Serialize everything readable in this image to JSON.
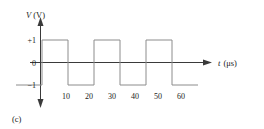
{
  "figure": {
    "caption": "(c)",
    "y_axis": {
      "label_variable": "V",
      "label_unit": "(V)",
      "ticks": [
        {
          "value": 1,
          "text": "+1"
        },
        {
          "value": 0,
          "text": "0"
        },
        {
          "value": -1,
          "text": "−1"
        }
      ]
    },
    "x_axis": {
      "label_variable": "t",
      "label_unit": "(μs)",
      "ticks": [
        {
          "value": 10,
          "text": "10"
        },
        {
          "value": 20,
          "text": "20"
        },
        {
          "value": 30,
          "text": "30"
        },
        {
          "value": 40,
          "text": "40"
        },
        {
          "value": 50,
          "text": "50"
        },
        {
          "value": 60,
          "text": "60"
        }
      ]
    }
  },
  "chart_data": {
    "type": "line",
    "title": "",
    "subtitle": "",
    "xlabel": "t (μs)",
    "ylabel": "V (V)",
    "xlim": [
      0,
      72
    ],
    "ylim": [
      -1.6,
      1.6
    ],
    "grid": false,
    "legend": null,
    "annotations": [
      "(c)"
    ],
    "waveform": "square",
    "period": 20,
    "amplitude": 1,
    "high_level": 1,
    "low_level": -1,
    "duty_cycle": 0.5,
    "starts_at": -1,
    "transitions": [
      10,
      20,
      30,
      40,
      50,
      60
    ],
    "xticks": [
      10,
      20,
      30,
      40,
      50,
      60
    ],
    "yticks": [
      -1,
      0,
      1
    ],
    "series": [
      {
        "name": "V(t)",
        "color": "#8c8c8c",
        "x": [
          0,
          10,
          10,
          20,
          20,
          30,
          30,
          40,
          40,
          50,
          50,
          60,
          60,
          70
        ],
        "values": [
          -1,
          -1,
          1,
          1,
          -1,
          -1,
          1,
          1,
          -1,
          -1,
          1,
          1,
          -1,
          -1
        ]
      }
    ]
  }
}
